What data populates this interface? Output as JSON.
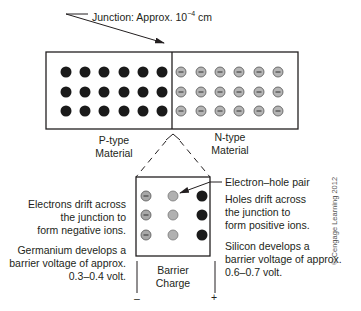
{
  "diagram": {
    "type": "pn-junction",
    "junction_label": "Junction: Approx. 10",
    "junction_exponent": "−4",
    "junction_unit": " cm",
    "regions": [
      {
        "name": "p-type",
        "line1": "P-type",
        "line2": "Material",
        "carrier": "hole",
        "dot_color": "#1a1a1a"
      },
      {
        "name": "n-type",
        "line1": "N-type",
        "line2": "Material",
        "carrier": "electron",
        "dot_color": "#b5b5b5"
      }
    ],
    "grid": {
      "rows": 3,
      "cols_per_region": 6
    },
    "barrier": {
      "line1": "Barrier",
      "line2": "Charge",
      "minus_sign": "–",
      "plus_sign": "+",
      "columns": [
        "negative-ion",
        "electron-hole-pair",
        "positive-ion"
      ]
    },
    "left_notes": {
      "drift": [
        "Electrons drift across",
        "the junction to",
        "form negative ions."
      ],
      "material": [
        "Germanium develops a",
        "barrier voltage of approx.",
        "0.3–0.4 volt."
      ]
    },
    "right_notes": {
      "pair_label": "Electron–hole pair",
      "drift": [
        "Holes drift across",
        "the junction to",
        "form positive ions."
      ],
      "material": [
        "Silicon develops a",
        "barrier voltage of approx.",
        "0.6–0.7 volt."
      ]
    },
    "copyright": "© Cengage Learning 2012",
    "colors": {
      "line": "#231f20",
      "hole_dot": "#1a1a1a",
      "electron_dot": "#b5b5b5",
      "electron_dot_border": "#555555",
      "pair_dot": "#b0b0b0"
    }
  }
}
